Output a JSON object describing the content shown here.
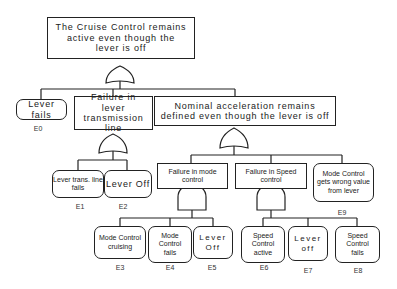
{
  "diagram": {
    "type": "fault-tree",
    "top_event": {
      "text": "The Cruise Control remains active even though the lever is off",
      "gate": "OR"
    },
    "intermediate": {
      "transmission": {
        "text": "Failure in lever transmission line",
        "gate": "OR"
      },
      "acceleration": {
        "text": "Nominal acceleration remains defined even though the lever is off",
        "gate": "OR"
      },
      "mode": {
        "text": "Failure in mode control",
        "gate": "AND"
      },
      "speed": {
        "text": "Failure in Speed control",
        "gate": "AND"
      }
    },
    "basic_events": {
      "e0": {
        "id": "E0",
        "text": "Lever fails"
      },
      "e1": {
        "id": "E1",
        "text": "Lever trans. line fails"
      },
      "e2": {
        "id": "E2",
        "text": "Lever Off"
      },
      "e3": {
        "id": "E3",
        "text": "Mode Control cruising"
      },
      "e4": {
        "id": "E4",
        "text": "Mode Control fails"
      },
      "e5": {
        "id": "E5",
        "text": "Lever Off"
      },
      "e6": {
        "id": "E6",
        "text": "Speed Control active"
      },
      "e7": {
        "id": "E7",
        "text": "Lever off"
      },
      "e8": {
        "id": "E8",
        "text": "Speed Control fails"
      },
      "e9": {
        "id": "E9",
        "text": "Mode Control gets wrong value from lever"
      }
    }
  }
}
